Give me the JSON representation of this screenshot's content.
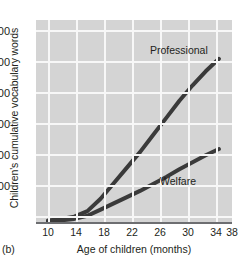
{
  "figure": {
    "panel_letter": "(b)"
  },
  "chart_data": {
    "type": "line",
    "title": "",
    "xlabel": "Age of children (months)",
    "ylabel": "Children's cumulative vocabulary words",
    "xlim": [
      10,
      38
    ],
    "ylim": [
      0,
      1300
    ],
    "xticks": [
      10,
      14,
      18,
      22,
      26,
      30,
      34,
      38
    ],
    "xtick_labels": [
      "10",
      "14",
      "18",
      "22",
      "26",
      "30",
      "34",
      "38"
    ],
    "yticks": [
      200,
      400,
      600,
      800,
      1000,
      1200
    ],
    "ytick_labels": [
      "200",
      "400",
      "600",
      "800",
      "1,000",
      "1,200"
    ],
    "grid": true,
    "grid_color": "#f7f7f7",
    "plot_background": "#d4d4d4",
    "line_color": "#3a3a3a",
    "legend_position": "inline-annotations",
    "series": [
      {
        "name": "Professional",
        "label": "Professional",
        "x": [
          10,
          12,
          14,
          16,
          18,
          20,
          22,
          24,
          26,
          28,
          30,
          32,
          34,
          36
        ],
        "values": [
          10,
          20,
          35,
          70,
          150,
          250,
          350,
          450,
          560,
          670,
          780,
          880,
          970,
          1050
        ]
      },
      {
        "name": "Welfare",
        "label": "Welfare",
        "x": [
          10,
          12,
          14,
          16,
          18,
          20,
          22,
          24,
          26,
          28,
          30,
          32,
          34,
          36
        ],
        "values": [
          5,
          10,
          20,
          40,
          80,
          120,
          160,
          200,
          245,
          290,
          340,
          385,
          430,
          470
        ]
      }
    ]
  }
}
